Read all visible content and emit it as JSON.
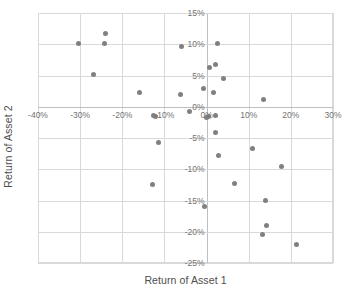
{
  "chart_data": {
    "type": "scatter",
    "title": "",
    "xlabel": "Return of Asset 1",
    "ylabel": "Return of Asset 2",
    "xlim": [
      -40,
      30
    ],
    "ylim": [
      -25,
      15
    ],
    "xticks": [
      -40,
      -30,
      -20,
      -10,
      0,
      10,
      20,
      30
    ],
    "yticks": [
      15,
      10,
      5,
      0,
      -5,
      -10,
      -15,
      -20,
      -25
    ],
    "xtick_labels": [
      "-40%",
      "-30%",
      "-20%",
      "-10%",
      "0%",
      "10%",
      "20%",
      "30%"
    ],
    "ytick_labels": [
      "15%",
      "10%",
      "5%",
      "0%",
      "-5%",
      "-10%",
      "-15%",
      "-20%",
      "-25%"
    ],
    "grid": true,
    "legend": false,
    "marker_color": "#808080",
    "marker_shape": "circle",
    "series": [
      {
        "name": "Returns",
        "points": [
          {
            "x": -30.4,
            "y": 10.1
          },
          {
            "x": -23.9,
            "y": 11.7
          },
          {
            "x": -24.2,
            "y": 10.2
          },
          {
            "x": -26.8,
            "y": 5.2
          },
          {
            "x": -15.8,
            "y": 2.3
          },
          {
            "x": -5.9,
            "y": 9.6
          },
          {
            "x": -6.2,
            "y": 1.9
          },
          {
            "x": -4.1,
            "y": -0.8
          },
          {
            "x": -12.2,
            "y": -1.5
          },
          {
            "x": -12.5,
            "y": -1.4
          },
          {
            "x": -11.4,
            "y": -5.7
          },
          {
            "x": -12.8,
            "y": -12.5
          },
          {
            "x": -0.7,
            "y": 3.0
          },
          {
            "x": 0.8,
            "y": 6.3
          },
          {
            "x": 2.0,
            "y": 6.7
          },
          {
            "x": 2.6,
            "y": 10.1
          },
          {
            "x": 4.0,
            "y": 4.5
          },
          {
            "x": 1.6,
            "y": 2.3
          },
          {
            "x": 0.1,
            "y": -1.7
          },
          {
            "x": 0.4,
            "y": -1.5
          },
          {
            "x": 2.2,
            "y": -1.4
          },
          {
            "x": 2.2,
            "y": -4.1
          },
          {
            "x": 2.8,
            "y": -7.8
          },
          {
            "x": 13.6,
            "y": 1.2
          },
          {
            "x": 11.0,
            "y": -6.7
          },
          {
            "x": 17.8,
            "y": -9.6
          },
          {
            "x": 6.6,
            "y": -12.3
          },
          {
            "x": -0.6,
            "y": -15.9
          },
          {
            "x": 14.0,
            "y": -15.0
          },
          {
            "x": 14.2,
            "y": -19.0
          },
          {
            "x": 13.2,
            "y": -20.5
          },
          {
            "x": 21.3,
            "y": -22.0
          }
        ]
      }
    ]
  },
  "axis": {
    "x_title": "Return of Asset 1",
    "y_title": "Return of Asset 2"
  }
}
